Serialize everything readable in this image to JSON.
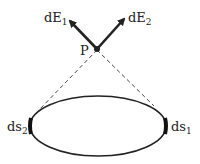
{
  "diagram": {
    "point_label": "P",
    "vectors": [
      {
        "label": "dE",
        "sub": "1"
      },
      {
        "label": "dE",
        "sub": "2"
      }
    ],
    "elements": [
      {
        "label": "ds",
        "sub": "1"
      },
      {
        "label": "ds",
        "sub": "2"
      }
    ],
    "colors": {
      "ink": "#222222",
      "background": "#ffffff"
    }
  }
}
